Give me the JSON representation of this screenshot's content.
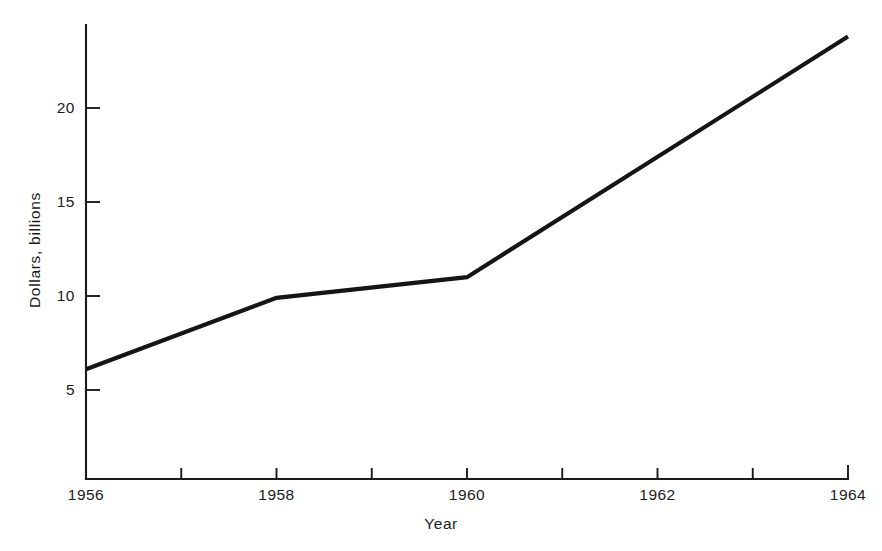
{
  "chart_data": {
    "type": "line",
    "title": "",
    "xlabel": "Year",
    "ylabel": "Dollars, billions",
    "x": [
      1956,
      1958,
      1960,
      1964
    ],
    "values": [
      6.1,
      9.9,
      11.0,
      23.8
    ],
    "series": [
      {
        "name": "Dollars, billions",
        "x": [
          1956,
          1958,
          1960,
          1964
        ],
        "values": [
          6.1,
          9.9,
          11.0,
          23.8
        ]
      }
    ],
    "xlim": [
      1956,
      1964
    ],
    "ylim": [
      0,
      24.6
    ],
    "xticks": [
      1956,
      1957,
      1958,
      1959,
      1960,
      1961,
      1962,
      1963,
      1964
    ],
    "xtick_labels": [
      "1956",
      "",
      "1958",
      "",
      "1960",
      "",
      "1962",
      "",
      "1964"
    ],
    "yticks": [
      5,
      10,
      15,
      20
    ],
    "ytick_labels": [
      "5",
      "10",
      "15",
      "20"
    ],
    "grid": false,
    "legend": false,
    "legend_position": "none",
    "line_color": "#151515",
    "axis_color": "#1b1b1b",
    "background_color": "#ffffff"
  },
  "axis": {
    "x_labels": [
      {
        "text": "1956",
        "value": 1956
      },
      {
        "text": "1958",
        "value": 1958
      },
      {
        "text": "1960",
        "value": 1960
      },
      {
        "text": "1962",
        "value": 1962
      },
      {
        "text": "1964",
        "value": 1964
      }
    ],
    "y_labels": [
      {
        "text": "5",
        "value": 5
      },
      {
        "text": "10",
        "value": 10
      },
      {
        "text": "15",
        "value": 15
      },
      {
        "text": "20",
        "value": 20
      }
    ],
    "x_title": "Year",
    "y_title": "Dollars, billions"
  }
}
